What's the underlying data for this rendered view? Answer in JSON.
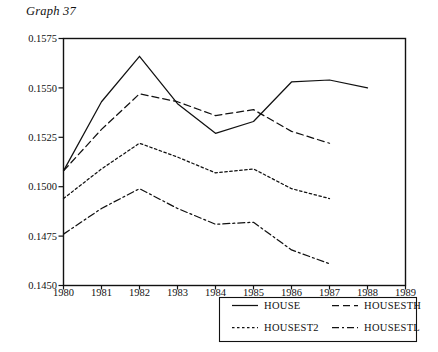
{
  "chart_data": {
    "type": "line",
    "title": "Graph 37",
    "xlabel": "",
    "ylabel": "",
    "x": [
      1980,
      1981,
      1982,
      1983,
      1984,
      1985,
      1986,
      1987,
      1988,
      1989
    ],
    "xlim": [
      1980,
      1989
    ],
    "ylim": [
      0.145,
      0.1575
    ],
    "yticks": [
      0.145,
      0.1475,
      0.15,
      0.1525,
      0.155,
      0.1575
    ],
    "ytick_labels": [
      "0.1450",
      "0.1475",
      "0.1500",
      "0.1525",
      "0.1550",
      "0.1575"
    ],
    "xtick_labels": [
      "1980",
      "1981",
      "1982",
      "1983",
      "1984",
      "1985",
      "1986",
      "1987",
      "1988",
      "1989"
    ],
    "grid": false,
    "legend_position": "below-center",
    "series": [
      {
        "name": "HOUSE",
        "style": "solid",
        "x": [
          1980,
          1981,
          1982,
          1983,
          1984,
          1985,
          1986,
          1987,
          1988
        ],
        "values": [
          0.1508,
          0.1543,
          0.1566,
          0.1542,
          0.1527,
          0.1533,
          0.1553,
          0.1554,
          0.155
        ]
      },
      {
        "name": "HOUSESTH",
        "style": "dashed",
        "x": [
          1980,
          1981,
          1982,
          1983,
          1984,
          1985,
          1986,
          1987
        ],
        "values": [
          0.1508,
          0.1529,
          0.1547,
          0.1543,
          0.1536,
          0.1539,
          0.1528,
          0.1522
        ]
      },
      {
        "name": "HOUSEST2",
        "style": "dotted",
        "x": [
          1980,
          1981,
          1982,
          1983,
          1984,
          1985,
          1986,
          1987
        ],
        "values": [
          0.1494,
          0.1509,
          0.1522,
          0.1515,
          0.1507,
          0.1509,
          0.1499,
          0.1494
        ]
      },
      {
        "name": "HOUSESTL",
        "style": "dashdot",
        "x": [
          1980,
          1981,
          1982,
          1983,
          1984,
          1985,
          1986,
          1987
        ],
        "values": [
          0.1476,
          0.1489,
          0.1499,
          0.1489,
          0.1481,
          0.1482,
          0.1468,
          0.1461
        ]
      }
    ]
  },
  "legend": {
    "entries": [
      {
        "label": "HOUSE",
        "style": "solid"
      },
      {
        "label": "HOUSESTH",
        "style": "dashed"
      },
      {
        "label": "HOUSEST2",
        "style": "dotted"
      },
      {
        "label": "HOUSESTL",
        "style": "dashdot"
      }
    ]
  }
}
